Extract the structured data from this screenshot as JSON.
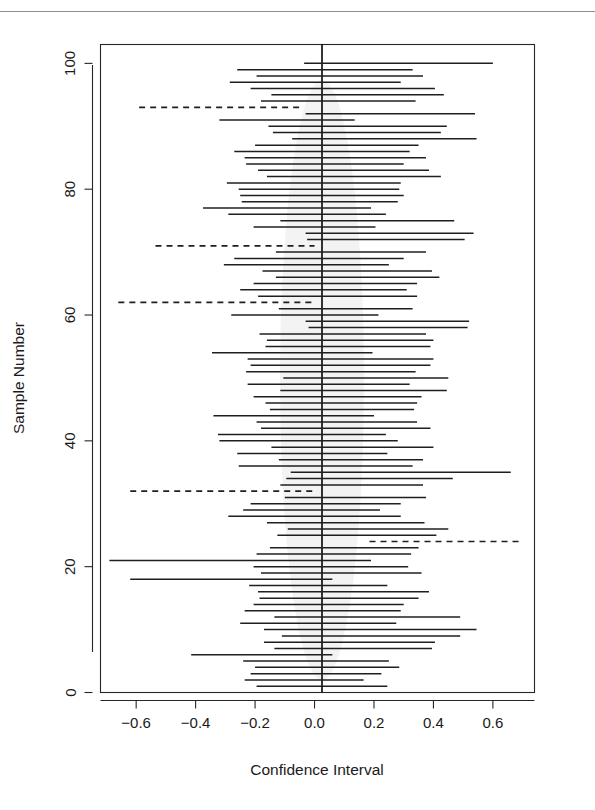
{
  "figure": {
    "background_color": "#ffffff",
    "line_color": "#1f1f1f",
    "rule_color": "#8c8c8c"
  },
  "chart_data": {
    "type": "line",
    "title": "",
    "subtitle": "",
    "xlabel": "Confidence Interval",
    "ylabel": "Sample Number",
    "xlim": [
      -0.72,
      0.74
    ],
    "ylim": [
      0,
      103
    ],
    "xticks": [
      -0.6,
      -0.4,
      -0.2,
      0.0,
      0.2,
      0.4,
      0.6
    ],
    "xtick_labels": [
      "-0.6",
      "-0.4",
      "-0.2",
      "0.0",
      "0.2",
      "0.4",
      "0.6"
    ],
    "yticks": [
      0,
      20,
      40,
      60,
      80,
      100
    ],
    "ytick_labels": [
      "0",
      "20",
      "40",
      "60",
      "80",
      "100"
    ],
    "grid": false,
    "legend": null,
    "annotations": [
      {
        "text": "vertical reference line at x = 0",
        "x": 0.0
      }
    ],
    "reference_line_x": 0.0,
    "n_intervals": 100,
    "n_missing_zero": 5,
    "series_note": "Each row is one simulated 95% confidence interval; dashed rows fail to contain 0.",
    "intervals": [
      {
        "sample": 100,
        "lower": -0.035,
        "upper": 0.6,
        "covers_zero": true
      },
      {
        "sample": 99,
        "lower": -0.26,
        "upper": 0.33,
        "covers_zero": true
      },
      {
        "sample": 98,
        "lower": -0.195,
        "upper": 0.365,
        "covers_zero": true
      },
      {
        "sample": 97,
        "lower": -0.285,
        "upper": 0.29,
        "covers_zero": true
      },
      {
        "sample": 96,
        "lower": -0.215,
        "upper": 0.405,
        "covers_zero": true
      },
      {
        "sample": 95,
        "lower": -0.145,
        "upper": 0.435,
        "covers_zero": true
      },
      {
        "sample": 94,
        "lower": -0.18,
        "upper": 0.34,
        "covers_zero": true
      },
      {
        "sample": 93,
        "lower": -0.59,
        "upper": -0.05,
        "covers_zero": false
      },
      {
        "sample": 92,
        "lower": -0.03,
        "upper": 0.54,
        "covers_zero": true
      },
      {
        "sample": 91,
        "lower": -0.32,
        "upper": 0.135,
        "covers_zero": true
      },
      {
        "sample": 90,
        "lower": -0.155,
        "upper": 0.445,
        "covers_zero": true
      },
      {
        "sample": 89,
        "lower": -0.14,
        "upper": 0.425,
        "covers_zero": true
      },
      {
        "sample": 88,
        "lower": -0.075,
        "upper": 0.545,
        "covers_zero": true
      },
      {
        "sample": 87,
        "lower": -0.2,
        "upper": 0.35,
        "covers_zero": true
      },
      {
        "sample": 86,
        "lower": -0.27,
        "upper": 0.32,
        "covers_zero": true
      },
      {
        "sample": 85,
        "lower": -0.235,
        "upper": 0.375,
        "covers_zero": true
      },
      {
        "sample": 84,
        "lower": -0.23,
        "upper": 0.3,
        "covers_zero": true
      },
      {
        "sample": 83,
        "lower": -0.19,
        "upper": 0.385,
        "covers_zero": true
      },
      {
        "sample": 82,
        "lower": -0.16,
        "upper": 0.425,
        "covers_zero": true
      },
      {
        "sample": 81,
        "lower": -0.295,
        "upper": 0.29,
        "covers_zero": true
      },
      {
        "sample": 80,
        "lower": -0.255,
        "upper": 0.285,
        "covers_zero": true
      },
      {
        "sample": 79,
        "lower": -0.25,
        "upper": 0.3,
        "covers_zero": true
      },
      {
        "sample": 78,
        "lower": -0.245,
        "upper": 0.28,
        "covers_zero": true
      },
      {
        "sample": 77,
        "lower": -0.375,
        "upper": 0.19,
        "covers_zero": true
      },
      {
        "sample": 76,
        "lower": -0.29,
        "upper": 0.24,
        "covers_zero": true
      },
      {
        "sample": 75,
        "lower": -0.115,
        "upper": 0.47,
        "covers_zero": true
      },
      {
        "sample": 74,
        "lower": -0.205,
        "upper": 0.205,
        "covers_zero": true
      },
      {
        "sample": 73,
        "lower": -0.03,
        "upper": 0.535,
        "covers_zero": true
      },
      {
        "sample": 72,
        "lower": -0.025,
        "upper": 0.505,
        "covers_zero": true
      },
      {
        "sample": 71,
        "lower": -0.535,
        "upper": 0.0,
        "covers_zero": false
      },
      {
        "sample": 70,
        "lower": -0.13,
        "upper": 0.375,
        "covers_zero": true
      },
      {
        "sample": 69,
        "lower": -0.27,
        "upper": 0.3,
        "covers_zero": true
      },
      {
        "sample": 68,
        "lower": -0.305,
        "upper": 0.25,
        "covers_zero": true
      },
      {
        "sample": 67,
        "lower": -0.175,
        "upper": 0.395,
        "covers_zero": true
      },
      {
        "sample": 66,
        "lower": -0.13,
        "upper": 0.42,
        "covers_zero": true
      },
      {
        "sample": 65,
        "lower": -0.205,
        "upper": 0.345,
        "covers_zero": true
      },
      {
        "sample": 64,
        "lower": -0.25,
        "upper": 0.31,
        "covers_zero": true
      },
      {
        "sample": 63,
        "lower": -0.19,
        "upper": 0.345,
        "covers_zero": true
      },
      {
        "sample": 62,
        "lower": -0.66,
        "upper": 0.0,
        "covers_zero": false
      },
      {
        "sample": 61,
        "lower": -0.12,
        "upper": 0.33,
        "covers_zero": true
      },
      {
        "sample": 60,
        "lower": -0.28,
        "upper": 0.215,
        "covers_zero": true
      },
      {
        "sample": 59,
        "lower": -0.03,
        "upper": 0.52,
        "covers_zero": true
      },
      {
        "sample": 58,
        "lower": -0.02,
        "upper": 0.515,
        "covers_zero": true
      },
      {
        "sample": 57,
        "lower": -0.185,
        "upper": 0.375,
        "covers_zero": true
      },
      {
        "sample": 56,
        "lower": -0.16,
        "upper": 0.4,
        "covers_zero": true
      },
      {
        "sample": 55,
        "lower": -0.165,
        "upper": 0.39,
        "covers_zero": true
      },
      {
        "sample": 54,
        "lower": -0.345,
        "upper": 0.195,
        "covers_zero": true
      },
      {
        "sample": 53,
        "lower": -0.225,
        "upper": 0.4,
        "covers_zero": true
      },
      {
        "sample": 52,
        "lower": -0.215,
        "upper": 0.39,
        "covers_zero": true
      },
      {
        "sample": 51,
        "lower": -0.23,
        "upper": 0.34,
        "covers_zero": true
      },
      {
        "sample": 50,
        "lower": -0.105,
        "upper": 0.45,
        "covers_zero": true
      },
      {
        "sample": 49,
        "lower": -0.225,
        "upper": 0.32,
        "covers_zero": true
      },
      {
        "sample": 48,
        "lower": -0.115,
        "upper": 0.445,
        "covers_zero": true
      },
      {
        "sample": 47,
        "lower": -0.205,
        "upper": 0.36,
        "covers_zero": true
      },
      {
        "sample": 46,
        "lower": -0.165,
        "upper": 0.345,
        "covers_zero": true
      },
      {
        "sample": 45,
        "lower": -0.15,
        "upper": 0.335,
        "covers_zero": true
      },
      {
        "sample": 44,
        "lower": -0.34,
        "upper": 0.2,
        "covers_zero": true
      },
      {
        "sample": 43,
        "lower": -0.195,
        "upper": 0.345,
        "covers_zero": true
      },
      {
        "sample": 42,
        "lower": -0.18,
        "upper": 0.39,
        "covers_zero": true
      },
      {
        "sample": 41,
        "lower": -0.325,
        "upper": 0.24,
        "covers_zero": true
      },
      {
        "sample": 40,
        "lower": -0.32,
        "upper": 0.28,
        "covers_zero": true
      },
      {
        "sample": 39,
        "lower": -0.145,
        "upper": 0.4,
        "covers_zero": true
      },
      {
        "sample": 38,
        "lower": -0.26,
        "upper": 0.245,
        "covers_zero": true
      },
      {
        "sample": 37,
        "lower": -0.12,
        "upper": 0.365,
        "covers_zero": true
      },
      {
        "sample": 36,
        "lower": -0.255,
        "upper": 0.33,
        "covers_zero": true
      },
      {
        "sample": 35,
        "lower": -0.08,
        "upper": 0.66,
        "covers_zero": true
      },
      {
        "sample": 34,
        "lower": -0.095,
        "upper": 0.465,
        "covers_zero": true
      },
      {
        "sample": 33,
        "lower": -0.115,
        "upper": 0.365,
        "covers_zero": true
      },
      {
        "sample": 32,
        "lower": -0.62,
        "upper": 0.0,
        "covers_zero": false
      },
      {
        "sample": 31,
        "lower": -0.1,
        "upper": 0.375,
        "covers_zero": true
      },
      {
        "sample": 30,
        "lower": -0.215,
        "upper": 0.29,
        "covers_zero": true
      },
      {
        "sample": 29,
        "lower": -0.24,
        "upper": 0.22,
        "covers_zero": true
      },
      {
        "sample": 28,
        "lower": -0.29,
        "upper": 0.29,
        "covers_zero": true
      },
      {
        "sample": 27,
        "lower": -0.16,
        "upper": 0.37,
        "covers_zero": true
      },
      {
        "sample": 26,
        "lower": -0.09,
        "upper": 0.45,
        "covers_zero": true
      },
      {
        "sample": 25,
        "lower": -0.125,
        "upper": 0.41,
        "covers_zero": true
      },
      {
        "sample": 24,
        "lower": 0.185,
        "upper": 0.7,
        "covers_zero": false
      },
      {
        "sample": 23,
        "lower": -0.15,
        "upper": 0.35,
        "covers_zero": true
      },
      {
        "sample": 22,
        "lower": -0.195,
        "upper": 0.325,
        "covers_zero": true
      },
      {
        "sample": 21,
        "lower": -0.69,
        "upper": 0.19,
        "covers_zero": true
      },
      {
        "sample": 20,
        "lower": -0.205,
        "upper": 0.315,
        "covers_zero": true
      },
      {
        "sample": 19,
        "lower": -0.18,
        "upper": 0.36,
        "covers_zero": true
      },
      {
        "sample": 18,
        "lower": -0.62,
        "upper": 0.06,
        "covers_zero": true
      },
      {
        "sample": 17,
        "lower": -0.22,
        "upper": 0.245,
        "covers_zero": true
      },
      {
        "sample": 16,
        "lower": -0.19,
        "upper": 0.385,
        "covers_zero": true
      },
      {
        "sample": 15,
        "lower": -0.185,
        "upper": 0.35,
        "covers_zero": true
      },
      {
        "sample": 14,
        "lower": -0.205,
        "upper": 0.3,
        "covers_zero": true
      },
      {
        "sample": 13,
        "lower": -0.235,
        "upper": 0.29,
        "covers_zero": true
      },
      {
        "sample": 12,
        "lower": -0.135,
        "upper": 0.49,
        "covers_zero": true
      },
      {
        "sample": 11,
        "lower": -0.25,
        "upper": 0.275,
        "covers_zero": true
      },
      {
        "sample": 10,
        "lower": -0.17,
        "upper": 0.545,
        "covers_zero": true
      },
      {
        "sample": 9,
        "lower": -0.11,
        "upper": 0.49,
        "covers_zero": true
      },
      {
        "sample": 8,
        "lower": -0.17,
        "upper": 0.405,
        "covers_zero": true
      },
      {
        "sample": 7,
        "lower": -0.135,
        "upper": 0.395,
        "covers_zero": true
      },
      {
        "sample": 6,
        "lower": -0.415,
        "upper": 0.06,
        "covers_zero": true
      },
      {
        "sample": 5,
        "lower": -0.24,
        "upper": 0.25,
        "covers_zero": true
      },
      {
        "sample": 4,
        "lower": -0.2,
        "upper": 0.285,
        "covers_zero": true
      },
      {
        "sample": 3,
        "lower": -0.215,
        "upper": 0.225,
        "covers_zero": true
      },
      {
        "sample": 2,
        "lower": -0.235,
        "upper": 0.165,
        "covers_zero": true
      },
      {
        "sample": 1,
        "lower": -0.195,
        "upper": 0.245,
        "covers_zero": true
      }
    ]
  }
}
